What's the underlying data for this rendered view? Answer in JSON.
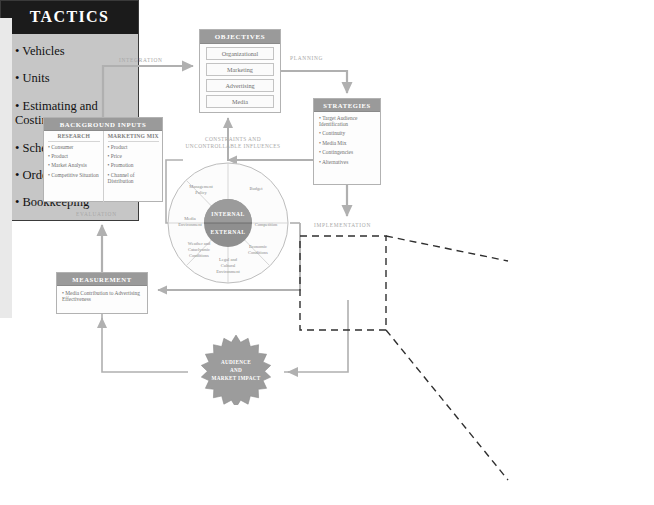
{
  "diagram": {
    "colors": {
      "header_gray": "#9a9a9a",
      "tactics_header": "#1b1b1b",
      "tactics_body": "#c6c6c6",
      "circle_core": "#8f8f8f",
      "star_fill": "#9c9c9c",
      "line": "#b0b0b0",
      "text_gray": "#6f6f6f"
    },
    "objectives": {
      "title": "OBJECTIVES",
      "items": [
        "Organizational",
        "Marketing",
        "Advertising",
        "Media"
      ]
    },
    "background_inputs": {
      "title": "BACKGROUND INPUTS",
      "columns": [
        {
          "header": "RESEARCH",
          "items": [
            "Consumer",
            "Product",
            "Market Analysis",
            "Competitive Situation"
          ]
        },
        {
          "header": "MARKETING MIX",
          "items": [
            "Product",
            "Price",
            "Promotion",
            "Channel of Distribution"
          ]
        }
      ]
    },
    "strategies": {
      "title": "STRATEGIES",
      "items": [
        "Target Audience Identification",
        "Continuity",
        "Media Mix",
        "Contingencies",
        "Alternatives"
      ]
    },
    "measurement": {
      "title": "MEASUREMENT",
      "items": [
        "Media Contribution to Advertising Effectiveness"
      ]
    },
    "tactics": {
      "title": "TACTICS",
      "items": [
        "Vehicles",
        "Units",
        "Estimating and Costing",
        "Scheduling",
        "Ordering",
        "Bookkeeping"
      ]
    },
    "constraints_wheel": {
      "caption_line1": "CONSTRAINTS AND",
      "caption_line2": "UNCONTROLLABLE INFLUENCES",
      "core_top": "INTERNAL",
      "core_bottom": "EXTERNAL",
      "segments": [
        {
          "name": "Management Policy",
          "lines": [
            "Management",
            "Policy"
          ]
        },
        {
          "name": "Budget",
          "lines": [
            "Budget"
          ]
        },
        {
          "name": "Competition",
          "lines": [
            "Competition"
          ]
        },
        {
          "name": "Economic Conditions",
          "lines": [
            "Economic",
            "Conditions"
          ]
        },
        {
          "name": "Legal and Cultural Environment",
          "lines": [
            "Legal and",
            "Cultural",
            "Environment"
          ]
        },
        {
          "name": "Weather and Cataclysmic Conditions",
          "lines": [
            "Weather and",
            "Cataclysmic",
            "Conditions"
          ]
        },
        {
          "name": "Media Environment",
          "lines": [
            "Media",
            "Environment"
          ]
        }
      ]
    },
    "impact_star": {
      "lines": [
        "AUDIENCE",
        "AND",
        "MARKET IMPACT"
      ]
    },
    "flow_labels": {
      "integration": "INTEGRATION",
      "planning": "PLANNING",
      "implementation": "IMPLEMENTATION",
      "evaluation": "EVALUATION"
    }
  }
}
